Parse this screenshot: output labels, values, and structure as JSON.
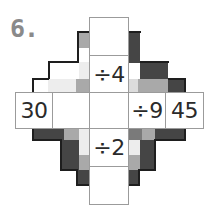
{
  "puzzle": {
    "number_label": "6.",
    "colors": {
      "dark": "#454545",
      "mid": "#a9a9a9",
      "light": "#dcdcdc",
      "cell_border": "#9b9b9b",
      "text": "#2a2a2a",
      "label": "#8a8a8a"
    },
    "horizontal_row": [
      {
        "id": "h1",
        "value": "30"
      },
      {
        "id": "h2",
        "value": ""
      },
      {
        "id": "center",
        "value": ""
      },
      {
        "id": "h4",
        "value": "÷9"
      },
      {
        "id": "h5",
        "value": "45"
      }
    ],
    "vertical_column": [
      {
        "id": "v1",
        "value": ""
      },
      {
        "id": "v2",
        "value": "÷4"
      },
      {
        "id": "center",
        "value": ""
      },
      {
        "id": "v4",
        "value": "÷2"
      },
      {
        "id": "v5",
        "value": ""
      }
    ]
  }
}
